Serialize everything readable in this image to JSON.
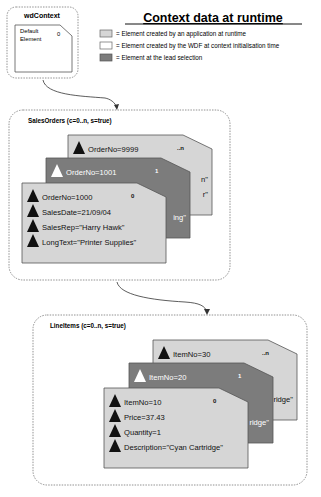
{
  "title": "Context data at runtime",
  "legend": [
    {
      "swatch": "light",
      "color": "#d6d6d6",
      "label": "= Element created by an application at runtime"
    },
    {
      "swatch": "white",
      "color": "#ffffff",
      "label": "= Element created by the WDF at context initialisation time"
    },
    {
      "swatch": "dark",
      "color": "#7c7c7c",
      "label": "= Element at the lead selection"
    }
  ],
  "colors": {
    "light": "#d6d6d6",
    "dark": "#7c7c7c",
    "border": "#555555"
  },
  "root": {
    "name": "wdContext",
    "element": {
      "line1": "Default",
      "line2": "Element",
      "index": "0"
    }
  },
  "sales_orders": {
    "label": "SalesOrders (c=0..n, s=true)",
    "cards": [
      {
        "kind": "light",
        "index": "..n",
        "attrs": [
          "OrderNo=9999"
        ],
        "peek": [
          "n\"",
          "r\""
        ]
      },
      {
        "kind": "dark",
        "index": "1",
        "attrs": [
          "OrderNo=1001"
        ],
        "peek": [
          "ing\""
        ]
      },
      {
        "kind": "light",
        "index": "0",
        "attrs": [
          "OrderNo=1000",
          "SalesDate=21/09/04",
          "SalesRep=\"Harry Hawk\"",
          "LongText=\"Printer Supplies\""
        ]
      }
    ]
  },
  "line_items": {
    "label": "LineItems (c=0..n, s=true)",
    "cards": [
      {
        "kind": "light",
        "index": "..n",
        "attrs": [
          "ItemNo=30"
        ],
        "peek": [
          "ridge\""
        ]
      },
      {
        "kind": "dark",
        "index": "1",
        "attrs": [
          "ItemNo=20"
        ],
        "peek": [
          "ridge\""
        ]
      },
      {
        "kind": "light",
        "index": "0",
        "attrs": [
          "ItemNo=10",
          "Price=37.43",
          "Quantity=1",
          "Description=\"Cyan Cartridge\""
        ]
      }
    ]
  }
}
